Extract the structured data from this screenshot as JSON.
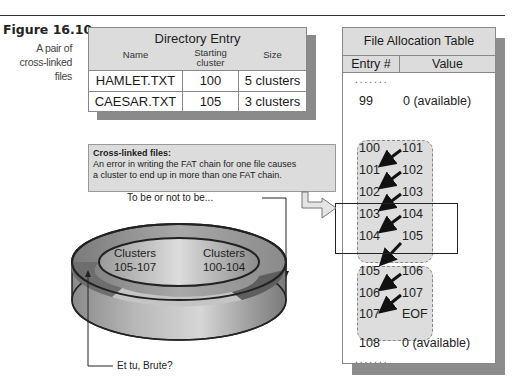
{
  "figure": {
    "number": "Figure 16.10",
    "caption_line1": "A pair of",
    "caption_line2": "cross-linked files"
  },
  "directory_entry": {
    "title": "Directory Entry",
    "columns": {
      "name": "Name",
      "starting_cluster_line1": "Starting",
      "starting_cluster_line2": "cluster",
      "size": "Size"
    },
    "rows": [
      {
        "name": "HAMLET.TXT",
        "starting_cluster": "100",
        "size": "5 clusters"
      },
      {
        "name": "CAESAR.TXT",
        "starting_cluster": "105",
        "size": "3 clusters"
      }
    ]
  },
  "fat": {
    "title": "File Allocation Table",
    "columns": {
      "entry": "Entry #",
      "value": "Value"
    },
    "ellipsis": ".......",
    "entries": [
      {
        "entry": "99",
        "value": "0 (available)"
      },
      {
        "entry": "100",
        "value": "101"
      },
      {
        "entry": "101",
        "value": "102"
      },
      {
        "entry": "102",
        "value": "103"
      },
      {
        "entry": "103",
        "value": "104"
      },
      {
        "entry": "104",
        "value": "105"
      },
      {
        "entry": "105",
        "value": "106"
      },
      {
        "entry": "106",
        "value": "107"
      },
      {
        "entry": "107",
        "value": "EOF"
      },
      {
        "entry": "108",
        "value": "0 (available)"
      }
    ]
  },
  "callout": {
    "title": "Cross-linked files:",
    "line1": "An error in writing the FAT chain for one file causes",
    "line2": "a cluster to end up in more than one FAT chain."
  },
  "disc": {
    "left_label_line1": "Clusters",
    "left_label_line2": "105-107",
    "right_label_line1": "Clusters",
    "right_label_line2": "100-104"
  },
  "annotations": {
    "top": "To be or not to be...",
    "bottom": "Et tu, Brute?"
  },
  "colors": {
    "header_gray": "#dcdcdc",
    "shadow_gray": "#8a8a8a",
    "chain_gray": "#dddddd",
    "disc_dark": "#6e6e6e"
  }
}
